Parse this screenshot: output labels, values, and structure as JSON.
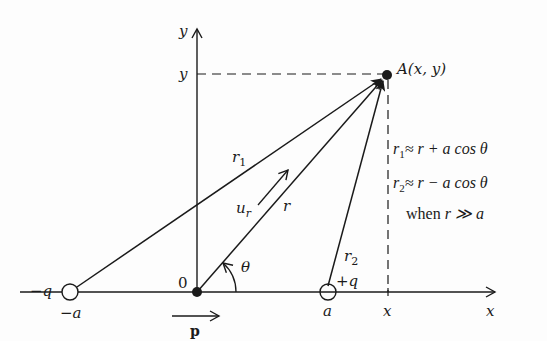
{
  "figure": {
    "point_A_label": "A(x, y)",
    "axes": {
      "y_axis_label": "y",
      "y_tick_label": "y",
      "x_axis_label": "x",
      "x_tick_label": "x",
      "origin_label": "0"
    },
    "charges": {
      "negative": {
        "charge_label": "−q",
        "position_label": "−a"
      },
      "positive": {
        "charge_label": "+q",
        "position_label": "a"
      }
    },
    "vectors": {
      "r1": {
        "symbol": "r",
        "subscript": "1"
      },
      "r2": {
        "symbol": "r",
        "subscript": "2"
      },
      "r": {
        "symbol": "r"
      },
      "unit_vector": {
        "symbol": "u",
        "subscript": "r"
      },
      "dipole_moment": {
        "symbol": "p"
      }
    },
    "angle_label": "θ",
    "equations": [
      {
        "lhs": "r",
        "sub": "1",
        "rhs": "≈ r + a cos θ"
      },
      {
        "lhs": "r",
        "sub": "2",
        "rhs": "≈ r − a cos θ"
      }
    ],
    "condition": {
      "prefix": "when",
      "expr": "r ≫ a"
    }
  },
  "colors": {
    "ink": "#1a1a1a",
    "background": "#fdfdfd"
  }
}
